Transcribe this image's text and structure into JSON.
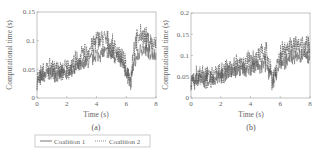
{
  "chart_data": [
    {
      "type": "line",
      "panel": "(a)",
      "title": "",
      "xlabel": "Time (s)",
      "ylabel": "Computational time (s)",
      "xlim": [
        0,
        8
      ],
      "ylim": [
        0,
        0.15
      ],
      "xticks": [
        "0",
        "2",
        "4",
        "6",
        "8"
      ],
      "yticks": [
        "0",
        "0.05",
        "0.1",
        "0.15"
      ],
      "grid": false,
      "x": [
        0,
        0.5,
        1,
        1.5,
        2,
        2.5,
        3,
        3.5,
        4,
        4.5,
        5,
        5.5,
        6,
        6.3,
        6.5,
        7,
        7.5,
        8
      ],
      "series": [
        {
          "name": "Coalition 1",
          "style": "solid",
          "values": [
            0.03,
            0.04,
            0.045,
            0.04,
            0.045,
            0.05,
            0.055,
            0.065,
            0.075,
            0.08,
            0.075,
            0.07,
            0.045,
            0.03,
            0.06,
            0.085,
            0.08,
            0.075
          ]
        },
        {
          "name": "Coalition 2",
          "style": "dotted",
          "values": [
            0.035,
            0.045,
            0.055,
            0.045,
            0.05,
            0.06,
            0.07,
            0.085,
            0.1,
            0.105,
            0.09,
            0.08,
            0.05,
            0.03,
            0.09,
            0.11,
            0.1,
            0.09
          ]
        }
      ]
    },
    {
      "type": "line",
      "panel": "(b)",
      "title": "",
      "xlabel": "Time (s)",
      "ylabel": "Computational time (s)",
      "xlim": [
        0,
        8
      ],
      "ylim": [
        0,
        0.2
      ],
      "xticks": [
        "0",
        "2",
        "4",
        "6",
        "8"
      ],
      "yticks": [
        "0",
        "0.05",
        "0.1",
        "0.15",
        "0.2"
      ],
      "grid": false,
      "x": [
        0,
        0.5,
        1,
        1.5,
        2,
        2.5,
        3,
        3.5,
        4,
        4.5,
        5,
        5.5,
        6,
        6.5,
        7,
        7.5,
        8
      ],
      "series": [
        {
          "name": "Coalition 1",
          "style": "solid",
          "values": [
            0.035,
            0.045,
            0.045,
            0.045,
            0.05,
            0.06,
            0.065,
            0.07,
            0.07,
            0.075,
            0.08,
            0.04,
            0.085,
            0.09,
            0.095,
            0.1,
            0.1
          ]
        },
        {
          "name": "Coalition 2",
          "style": "dotted",
          "values": [
            0.04,
            0.05,
            0.05,
            0.05,
            0.06,
            0.07,
            0.075,
            0.085,
            0.085,
            0.09,
            0.11,
            0.04,
            0.1,
            0.12,
            0.13,
            0.12,
            0.12
          ]
        }
      ]
    }
  ],
  "legend": {
    "items": [
      {
        "label": "Coalition 1",
        "style": "solid"
      },
      {
        "label": "Coalition 2",
        "style": "dotted"
      }
    ]
  },
  "captions": {
    "a": "(a)",
    "b": "(b)"
  }
}
